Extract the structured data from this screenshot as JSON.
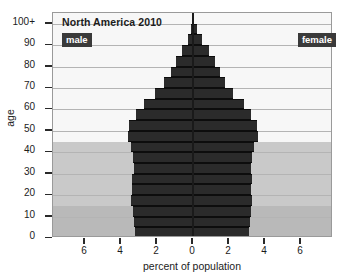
{
  "chart_data": {
    "type": "bar",
    "subtype": "population-pyramid",
    "title": "North America 2010",
    "xlabel": "percent of population",
    "ylabel": "age",
    "xlim": [
      -7.78,
      7.78
    ],
    "ylim": [
      0,
      105
    ],
    "grid": true,
    "x_ticks": [
      {
        "value": -6,
        "label": "6"
      },
      {
        "value": -4,
        "label": "4"
      },
      {
        "value": -2,
        "label": "2"
      },
      {
        "value": 0,
        "label": "0"
      },
      {
        "value": 2,
        "label": "2"
      },
      {
        "value": 4,
        "label": "4"
      },
      {
        "value": 6,
        "label": "6"
      }
    ],
    "y_ticks": [
      {
        "value": 0,
        "label": "0"
      },
      {
        "value": 10,
        "label": "10"
      },
      {
        "value": 20,
        "label": "20"
      },
      {
        "value": 30,
        "label": "30"
      },
      {
        "value": 40,
        "label": "40"
      },
      {
        "value": 50,
        "label": "50"
      },
      {
        "value": 60,
        "label": "60"
      },
      {
        "value": 70,
        "label": "70"
      },
      {
        "value": 80,
        "label": "80"
      },
      {
        "value": 90,
        "label": "90"
      },
      {
        "value": 100,
        "label": "100+"
      }
    ],
    "legend": [
      {
        "name": "male",
        "side": "left",
        "position": "top-left"
      },
      {
        "name": "female",
        "side": "right",
        "position": "top-right"
      }
    ],
    "bar_color": "#2b2b2b",
    "background_bands": [
      {
        "label": "age-45-plus",
        "y_from": 45,
        "y_to": 105,
        "color": "#f7f7f7"
      },
      {
        "label": "age-15-to-45",
        "y_from": 15,
        "y_to": 45,
        "color": "#c9c9c9"
      },
      {
        "label": "age-0-to-15",
        "y_from": 0,
        "y_to": 15,
        "color": "#b9b9b9"
      }
    ],
    "age_groups": [
      "0-4",
      "5-9",
      "10-14",
      "15-19",
      "20-24",
      "25-29",
      "30-34",
      "35-39",
      "40-44",
      "45-49",
      "50-54",
      "55-59",
      "60-64",
      "65-69",
      "70-74",
      "75-79",
      "80-84",
      "85-89",
      "90-94",
      "95-99",
      "100+"
    ],
    "series": [
      {
        "name": "male",
        "direction": "left",
        "values": [
          3.25,
          3.3,
          3.35,
          3.45,
          3.4,
          3.4,
          3.3,
          3.35,
          3.45,
          3.6,
          3.55,
          3.15,
          2.7,
          2.1,
          1.6,
          1.25,
          0.95,
          0.6,
          0.3,
          0.1,
          0.03
        ]
      },
      {
        "name": "female",
        "direction": "right",
        "values": [
          3.1,
          3.15,
          3.2,
          3.3,
          3.25,
          3.3,
          3.25,
          3.3,
          3.4,
          3.6,
          3.55,
          3.25,
          2.85,
          2.25,
          1.8,
          1.5,
          1.25,
          0.9,
          0.5,
          0.2,
          0.05
        ]
      }
    ]
  }
}
